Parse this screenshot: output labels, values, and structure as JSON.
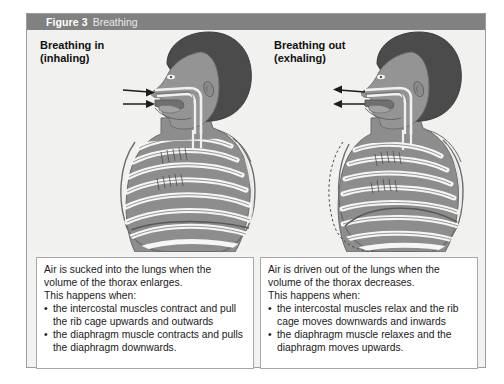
{
  "figure": {
    "number_label": "Figure 3",
    "title": "Breathing"
  },
  "panels": {
    "left": {
      "heading": "Breathing in\n(inhaling)",
      "illustration_name": "human-head-and-ribcage-inhaling-diagram",
      "airflow_direction": "in",
      "caption": {
        "intro": "Air is sucked into the lungs when the volume of the thorax enlarges.",
        "lead_in": "This happens when:",
        "bullets": [
          "the intercostal muscles contract and pull the rib cage upwards and outwards",
          "the diaphragm muscle contracts and pulls the diaphragm downwards."
        ]
      }
    },
    "right": {
      "heading": "Breathing out\n(exhaling)",
      "illustration_name": "human-head-and-ribcage-exhaling-diagram",
      "airflow_direction": "out",
      "caption": {
        "intro": "Air is driven out of the lungs when the volume of the thorax decreases.",
        "lead_in": "This happens when:",
        "bullets": [
          "the intercostal muscles relax and the rib cage moves downwards and inwards",
          "the diaphragm muscle relaxes and the diaphragm moves upwards."
        ]
      }
    }
  },
  "colors": {
    "header_bar": "#818181",
    "header_text": "#ffffff",
    "header_title_text": "#e9e9e9",
    "panel_background": "#f1f1ef",
    "frame_border": "#9d9d9d",
    "caption_background": "#ffffff",
    "caption_border": "#a8a8a8",
    "skin_tone": "#8f8f8f",
    "hair": "#4a4a4a",
    "rib_bone": "#f4f4f2",
    "muscle": "#8c8c8c"
  }
}
